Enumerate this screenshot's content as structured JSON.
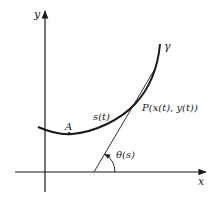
{
  "diagram": {
    "title": "",
    "axes": {
      "x_label": "x",
      "y_label": "y"
    },
    "curve": {
      "name": "γ",
      "arc_length_label": "s(t)"
    },
    "points": {
      "A": {
        "label": "A"
      },
      "P": {
        "label": "P(x(t), y(t))"
      }
    },
    "angle": {
      "label": "θ(s)"
    },
    "colors": {
      "ink": "#1a1a1a",
      "background": "#ffffff"
    }
  }
}
